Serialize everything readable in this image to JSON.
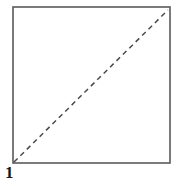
{
  "figure": {
    "label": "1",
    "shape_name": "square",
    "colors": {
      "background": "#ffffff",
      "outline": "#5a5a5a",
      "diagonal": "#4a4a4a",
      "label": "#1a1a1a"
    },
    "square": {
      "left": 13,
      "top": 7,
      "right": 170,
      "bottom": 163,
      "stroke_width": 1.6
    },
    "diagonal": {
      "from_x": 14,
      "from_y": 162,
      "to_x": 168,
      "to_y": 10,
      "style": "dashed",
      "dash_length": 5,
      "dash_gap": 4,
      "stroke_width": 1.5
    }
  }
}
